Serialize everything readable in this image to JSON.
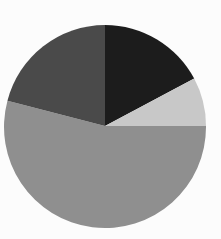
{
  "figure": {
    "background_color": "#fcfcfc",
    "width": 221,
    "height": 239,
    "title": "",
    "subtitle": ""
  },
  "chart_data": {
    "type": "pie",
    "title": "",
    "xlabel": "",
    "ylabel": "",
    "legend": false,
    "legend_position": "none",
    "grid": false,
    "labels_shown": false,
    "start_angle_deg": 0,
    "direction": "clockwise",
    "center": {
      "cx": 105,
      "cy": 126
    },
    "radius": 101,
    "categories": [
      "Slice 1",
      "Slice 2",
      "Slice 3",
      "Slice 4"
    ],
    "values": [
      17.2,
      7.8,
      54.2,
      20.8
    ],
    "percentages": [
      "17.2%",
      "7.8%",
      "54.2%",
      "20.8%"
    ],
    "colors": [
      "#1c1c1c",
      "#c8c8c8",
      "#8f8f8f",
      "#4a4a4a"
    ],
    "slices": [
      {
        "name": "Slice 1",
        "value": 17.2,
        "percent": "17.2%",
        "color": "#1c1c1c",
        "color_name": "near-black",
        "start_angle_deg": 0,
        "end_angle_deg": 62,
        "path": "M 105 126 L 105 25 A 101 101 0 0 1 194.18 78.58 Z"
      },
      {
        "name": "Slice 2",
        "value": 7.8,
        "percent": "7.8%",
        "color": "#c8c8c8",
        "color_name": "light-gray",
        "start_angle_deg": 62,
        "end_angle_deg": 90,
        "path": "M 105 126 L 194.18 78.58 A 101 101 0 0 1 206 126 Z"
      },
      {
        "name": "Slice 3",
        "value": 54.2,
        "percent": "54.2%",
        "color": "#8f8f8f",
        "color_name": "medium-gray",
        "start_angle_deg": 90,
        "end_angle_deg": 285,
        "path": "M 105 126 L 206 126 A 101 101 0 1 1 7.45 100.86 Z"
      },
      {
        "name": "Slice 4",
        "value": 20.8,
        "percent": "20.8%",
        "color": "#4a4a4a",
        "color_name": "dark-gray",
        "start_angle_deg": 285,
        "end_angle_deg": 360,
        "path": "M 105 126 L 7.45 100.86 A 101 101 0 0 1 105 25 Z"
      }
    ]
  },
  "accessibility": {
    "chart_description": "Pie chart with four unlabeled gray-scale slices"
  }
}
